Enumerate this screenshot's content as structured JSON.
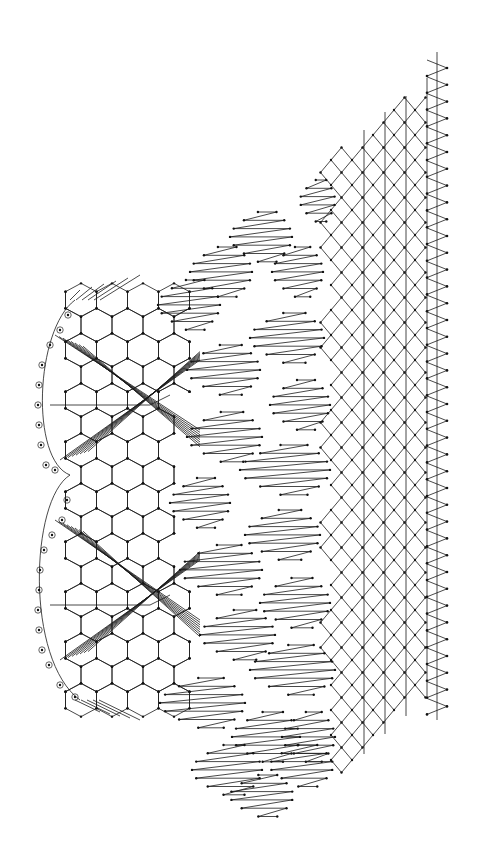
{
  "diagram": {
    "type": "lace-pricking",
    "colors": {
      "line": "#1a1a1a",
      "dot": "#111111",
      "background": "#ffffff"
    },
    "footside": {
      "line_x": 437,
      "y_start": 52,
      "y_end": 720,
      "picot_x": 447,
      "picot_start_y": 68,
      "picot_step": 16.8,
      "picot_count": 39
    },
    "ground": {
      "columns_x": [
        364,
        385,
        406,
        427
      ],
      "cell": 21,
      "top_apex": [
        417,
        85
      ],
      "left_points_x": 313,
      "notch_y": [
        170,
        237,
        337,
        437,
        537,
        637
      ],
      "bottom_y": 800
    },
    "fans": {
      "rows": [
        {
          "y0": 180,
          "x_left": 300,
          "x_right": 335,
          "lines": 6
        },
        {
          "y0": 212,
          "x_left": 230,
          "x_right": 292,
          "lines": 7
        },
        {
          "y0": 247,
          "x_left": 190,
          "x_right": 252,
          "lines": 7
        },
        {
          "y0": 247,
          "x_left": 272,
          "x_right": 323,
          "lines": 7
        },
        {
          "y0": 280,
          "x_left": 158,
          "x_right": 220,
          "lines": 7
        },
        {
          "y0": 313,
          "x_left": 250,
          "x_right": 324,
          "lines": 7
        },
        {
          "y0": 345,
          "x_left": 187,
          "x_right": 260,
          "lines": 7
        },
        {
          "y0": 380,
          "x_left": 270,
          "x_right": 330,
          "lines": 7
        },
        {
          "y0": 412,
          "x_left": 187,
          "x_right": 262,
          "lines": 7
        },
        {
          "y0": 445,
          "x_left": 240,
          "x_right": 330,
          "lines": 7
        },
        {
          "y0": 478,
          "x_left": 170,
          "x_right": 230,
          "lines": 7
        },
        {
          "y0": 510,
          "x_left": 245,
          "x_right": 320,
          "lines": 7
        },
        {
          "y0": 545,
          "x_left": 180,
          "x_right": 262,
          "lines": 7
        },
        {
          "y0": 578,
          "x_left": 260,
          "x_right": 330,
          "lines": 7
        },
        {
          "y0": 610,
          "x_left": 200,
          "x_right": 275,
          "lines": 7
        },
        {
          "y0": 645,
          "x_left": 250,
          "x_right": 335,
          "lines": 7
        },
        {
          "y0": 678,
          "x_left": 160,
          "x_right": 245,
          "lines": 7
        },
        {
          "y0": 712,
          "x_left": 232,
          "x_right": 300,
          "lines": 7
        },
        {
          "y0": 712,
          "x_left": 282,
          "x_right": 335,
          "lines": 7
        },
        {
          "y0": 745,
          "x_left": 192,
          "x_right": 262,
          "lines": 7
        },
        {
          "y0": 745,
          "x_left": 270,
          "x_right": 333,
          "lines": 6
        },
        {
          "y0": 775,
          "x_left": 230,
          "x_right": 293,
          "lines": 6
        }
      ]
    },
    "headside": {
      "scallops": [
        {
          "cx": 75,
          "cy": 400,
          "ry": 140
        },
        {
          "cx": 75,
          "cy": 600,
          "ry": 140
        }
      ],
      "hex_region": {
        "x0": 50,
        "x1": 200,
        "y0": 300,
        "y1": 720,
        "cell_w": 31,
        "cell_h": 50
      },
      "circled_pins": [
        [
          68,
          315
        ],
        [
          60,
          330
        ],
        [
          50,
          345
        ],
        [
          42,
          365
        ],
        [
          39,
          385
        ],
        [
          38,
          405
        ],
        [
          39,
          425
        ],
        [
          41,
          445
        ],
        [
          46,
          465
        ],
        [
          55,
          470
        ],
        [
          67,
          500
        ],
        [
          62,
          520
        ],
        [
          52,
          535
        ],
        [
          44,
          550
        ],
        [
          40,
          570
        ],
        [
          39,
          590
        ],
        [
          38,
          610
        ],
        [
          39,
          630
        ],
        [
          42,
          650
        ],
        [
          49,
          665
        ],
        [
          60,
          685
        ],
        [
          75,
          697
        ]
      ]
    }
  }
}
